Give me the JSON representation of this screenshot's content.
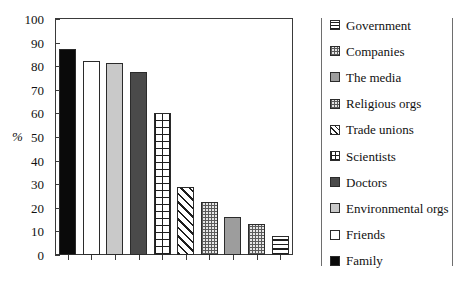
{
  "chart_data": {
    "type": "bar",
    "title": "",
    "xlabel": "",
    "ylabel": "%",
    "ylim": [
      0,
      100
    ],
    "ytick_step": 10,
    "yticks": [
      "100",
      "90",
      "80",
      "70",
      "60",
      "50",
      "40",
      "30",
      "20",
      "10",
      "0"
    ],
    "grid": false,
    "legend_position": "right",
    "categories": [
      "Family",
      "Friends",
      "Environmental orgs",
      "Doctors",
      "Scientists",
      "Trade unions",
      "Religious orgs",
      "The media",
      "Companies",
      "Government"
    ],
    "values": [
      87.5,
      82,
      81.5,
      77.5,
      60,
      29,
      22.5,
      16,
      13,
      8
    ],
    "bars": [
      {
        "label": "Family",
        "value": 87.5,
        "pattern": "solid-black"
      },
      {
        "label": "Friends",
        "value": 82,
        "pattern": "white"
      },
      {
        "label": "Environmental orgs",
        "value": 81.5,
        "pattern": "light-gray"
      },
      {
        "label": "Doctors",
        "value": 77.5,
        "pattern": "dark-gray"
      },
      {
        "label": "Scientists",
        "value": 60,
        "pattern": "grid"
      },
      {
        "label": "Trade unions",
        "value": 29,
        "pattern": "diagonal-stripes"
      },
      {
        "label": "Religious orgs",
        "value": 22.5,
        "pattern": "checker"
      },
      {
        "label": "The media",
        "value": 16,
        "pattern": "medium-gray"
      },
      {
        "label": "Companies",
        "value": 13,
        "pattern": "checker"
      },
      {
        "label": "Government",
        "value": 8,
        "pattern": "horizontal-lines"
      }
    ],
    "legend": [
      {
        "label": "Government",
        "pattern": "horizontal-lines"
      },
      {
        "label": "Companies",
        "pattern": "checker"
      },
      {
        "label": "The media",
        "pattern": "medium-gray"
      },
      {
        "label": "Religious orgs",
        "pattern": "checker"
      },
      {
        "label": "Trade unions",
        "pattern": "diagonal-stripes"
      },
      {
        "label": "Scientists",
        "pattern": "grid"
      },
      {
        "label": "Doctors",
        "pattern": "dark-gray"
      },
      {
        "label": "Environmental orgs",
        "pattern": "light-gray"
      },
      {
        "label": "Friends",
        "pattern": "white"
      },
      {
        "label": "Family",
        "pattern": "solid-black"
      }
    ]
  },
  "colors": {
    "axis": "#3a3a3a",
    "bar_outline": "#2b2b2b",
    "text": "#111111",
    "background": "#ffffff",
    "legend_separator": "#6e6e6e"
  }
}
